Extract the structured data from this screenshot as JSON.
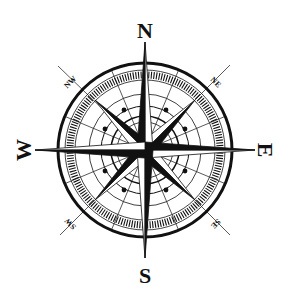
{
  "image": {
    "subject": "compass rose",
    "colors": {
      "ink": "#111111",
      "background": "#ffffff"
    }
  },
  "cardinals": {
    "north": "N",
    "east": "E",
    "south": "S",
    "west": "W"
  },
  "intercardinals": {
    "northeast": "NE",
    "southeast": "SE",
    "southwest": "SW",
    "northwest": "NW"
  }
}
